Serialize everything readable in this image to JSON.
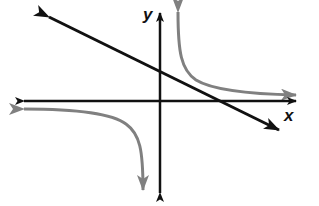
{
  "diagram": {
    "type": "coordinate-plane-graph",
    "axes": {
      "x_label": "x",
      "y_label": "y",
      "color": "#111111"
    },
    "curves": [
      {
        "id": "line",
        "kind": "straight line, negative slope",
        "color": "#111111",
        "arrow_ends": [
          "upper-left",
          "lower-right"
        ]
      },
      {
        "id": "hyperbola-upper-right",
        "kind": "rational branch in quadrant I, approaching positive y and positive x directions",
        "color": "#808080",
        "arrow_ends": [
          "up",
          "right"
        ]
      },
      {
        "id": "hyperbola-lower-left",
        "kind": "rational branch in quadrant III, approaching negative x and negative y directions",
        "color": "#808080",
        "arrow_ends": [
          "left",
          "down"
        ]
      }
    ]
  },
  "colors": {
    "axis": "#111111",
    "line": "#111111",
    "hyperbola": "#808080",
    "background": "#ffffff"
  }
}
